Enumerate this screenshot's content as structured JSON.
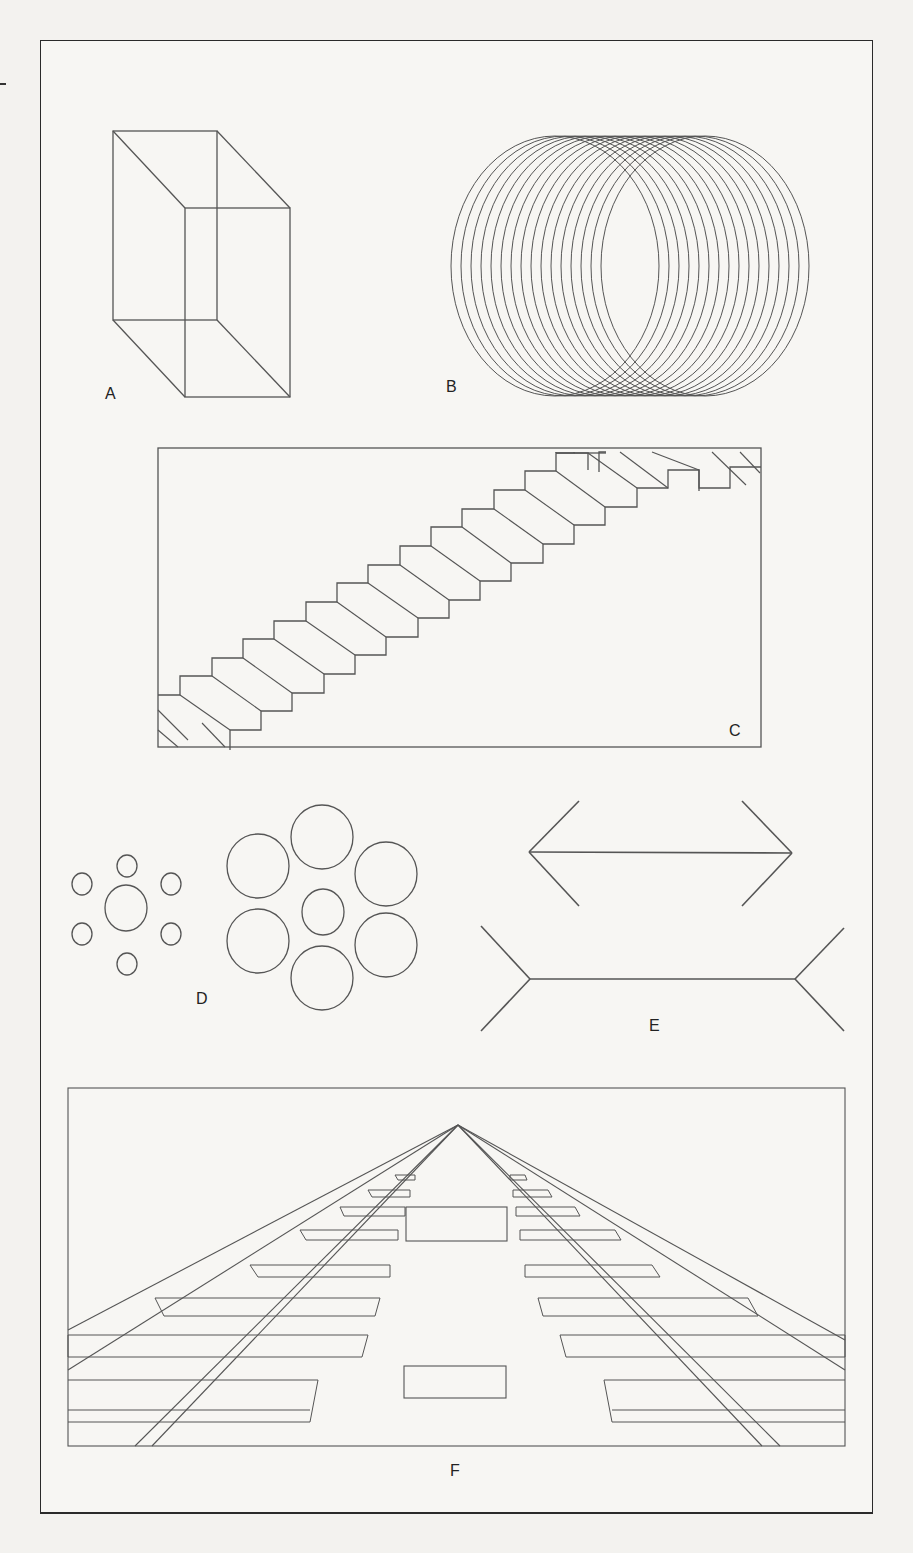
{
  "figure": {
    "panels": [
      {
        "id": "A",
        "label": "A",
        "description": "Necker cube (reversible wireframe cube)"
      },
      {
        "id": "B",
        "label": "B",
        "description": "Overlapping rings forming a reversible cylinder/coil"
      },
      {
        "id": "C",
        "label": "C",
        "description": "Schröder staircase with hatched risers"
      },
      {
        "id": "D",
        "label": "D",
        "description": "Ebbinghaus illusion: equal central circles surrounded by small vs large circles"
      },
      {
        "id": "E",
        "label": "E",
        "description": "Müller-Lyer illusion: equal shafts with inward vs outward fins"
      },
      {
        "id": "F",
        "label": "F",
        "description": "Ponzo illusion: equal rectangles on converging railroad tracks"
      }
    ]
  },
  "colors": {
    "line": "#555555",
    "frame": "#2a2a2a",
    "background": "#f3f2ef"
  }
}
